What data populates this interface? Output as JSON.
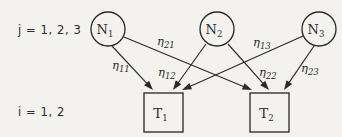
{
  "diagram": {
    "background_color": "#f4f2ee",
    "ink_color": "#2b2b2b",
    "index_labels": {
      "top": "j = 1, 2, 3",
      "bottom": "i = 1, 2"
    },
    "source_nodes": [
      {
        "id": "N1",
        "base": "N",
        "subscript": "1",
        "cx": 108,
        "cy": 29,
        "r": 17
      },
      {
        "id": "N2",
        "base": "N",
        "subscript": "2",
        "cx": 217,
        "cy": 29,
        "r": 17
      },
      {
        "id": "N3",
        "base": "N",
        "subscript": "3",
        "cx": 319,
        "cy": 29,
        "r": 17
      }
    ],
    "target_nodes": [
      {
        "id": "T1",
        "base": "T",
        "subscript": "1",
        "x": 144,
        "y": 93,
        "w": 39,
        "h": 39
      },
      {
        "id": "T2",
        "base": "T",
        "subscript": "2",
        "x": 250,
        "y": 93,
        "w": 39,
        "h": 39
      }
    ],
    "edges": [
      {
        "id": "eta11",
        "base": "η",
        "subscript": "11",
        "from": "N1",
        "to": "T1",
        "x1": 112,
        "y1": 46,
        "x2": 153,
        "y2": 90,
        "label_x": 112,
        "label_y": 69
      },
      {
        "id": "eta21",
        "base": "η",
        "subscript": "21",
        "from": "N1",
        "to": "T2",
        "x1": 124,
        "y1": 37,
        "x2": 252,
        "y2": 90,
        "label_x": 157,
        "label_y": 45
      },
      {
        "id": "eta12",
        "base": "η",
        "subscript": "12",
        "from": "N2",
        "to": "T1",
        "x1": 206,
        "y1": 44,
        "x2": 173,
        "y2": 90,
        "label_x": 158,
        "label_y": 76
      },
      {
        "id": "eta22",
        "base": "η",
        "subscript": "22",
        "from": "N2",
        "to": "T2",
        "x1": 228,
        "y1": 44,
        "x2": 269,
        "y2": 90,
        "label_x": 259,
        "label_y": 76
      },
      {
        "id": "eta13",
        "base": "η",
        "subscript": "13",
        "from": "N3",
        "to": "T1",
        "x1": 303,
        "y1": 36,
        "x2": 182,
        "y2": 90,
        "label_x": 253,
        "label_y": 46
      },
      {
        "id": "eta23",
        "base": "η",
        "subscript": "23",
        "from": "N3",
        "to": "T2",
        "x1": 314,
        "y1": 46,
        "x2": 284,
        "y2": 90,
        "label_x": 301,
        "label_y": 72
      }
    ]
  }
}
